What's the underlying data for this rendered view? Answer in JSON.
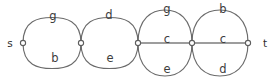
{
  "figure": {
    "type": "graph-diagram",
    "name": "multigraph-parallel-edges",
    "background_color": "#ffffff",
    "edge_color": "#6b6b6b",
    "label_color": "#3d3d3d",
    "width": 278,
    "height": 83
  },
  "terminals": [
    {
      "id": "s",
      "label": "s",
      "x": 10,
      "y": 44
    },
    {
      "id": "t",
      "label": "t",
      "x": 265,
      "y": 44
    }
  ],
  "vertices": [
    {
      "id": "v0",
      "x": 23,
      "y": 43,
      "r": 2.6
    },
    {
      "id": "v1",
      "x": 81,
      "y": 43,
      "r": 2.6
    },
    {
      "id": "v2",
      "x": 138,
      "y": 43,
      "r": 2.6
    },
    {
      "id": "v3",
      "x": 192,
      "y": 43,
      "r": 2.6
    },
    {
      "id": "v4",
      "x": 248,
      "y": 43,
      "r": 2.6
    }
  ],
  "edges": [
    {
      "id": "e0",
      "from": "v0",
      "to": "v1",
      "position": "top",
      "label": "g",
      "label_x": 53,
      "label_y": 16
    },
    {
      "id": "e1",
      "from": "v0",
      "to": "v1",
      "position": "bottom",
      "label": "b",
      "label_x": 55,
      "label_y": 58
    },
    {
      "id": "e2",
      "from": "v1",
      "to": "v2",
      "position": "top",
      "label": "d",
      "label_x": 109,
      "label_y": 15
    },
    {
      "id": "e3",
      "from": "v1",
      "to": "v2",
      "position": "bottom",
      "label": "e",
      "label_x": 110,
      "label_y": 58
    },
    {
      "id": "e4",
      "from": "v2",
      "to": "v3",
      "position": "top",
      "label": "g",
      "label_x": 167,
      "label_y": 9
    },
    {
      "id": "e5",
      "from": "v2",
      "to": "v3",
      "position": "middle",
      "label": "c",
      "label_x": 167,
      "label_y": 39
    },
    {
      "id": "e6",
      "from": "v2",
      "to": "v3",
      "position": "bottom",
      "label": "e",
      "label_x": 167,
      "label_y": 69
    },
    {
      "id": "e7",
      "from": "v3",
      "to": "v4",
      "position": "top",
      "label": "b",
      "label_x": 223,
      "label_y": 9
    },
    {
      "id": "e8",
      "from": "v3",
      "to": "v4",
      "position": "middle",
      "label": "c",
      "label_x": 223,
      "label_y": 39
    },
    {
      "id": "e9",
      "from": "v3",
      "to": "v4",
      "position": "bottom",
      "label": "d",
      "label_x": 223,
      "label_y": 69
    }
  ],
  "edge_geometry": [
    {
      "id": "e0",
      "d": "M 23 43 C 23 20.5 38.5 17.5 52 17.5 C 65.5 17.5 81 20.5 81 43"
    },
    {
      "id": "e1",
      "d": "M 23 43 C 23 65.5 38.5 68.5 52 68.5 C 65.5 68.5 81 65.5 81 43"
    },
    {
      "id": "e2",
      "d": "M 81 43 C 81 20.5 96 17.5 109.5 17.5 C 123 17.5 138 20.5 138 43"
    },
    {
      "id": "e3",
      "d": "M 81 43 C 81 65.5 96 68.5 109.5 68.5 C 123 68.5 138 65.5 138 43"
    },
    {
      "id": "e4",
      "d": "M 138 43 C 138 18 152 10 165 10 C 178 10 192 18 192 43"
    },
    {
      "id": "e5",
      "d": "M 138 43 L 192 43"
    },
    {
      "id": "e6",
      "d": "M 138 43 C 138 68 152 76 165 76 C 178 76 192 68 192 43"
    },
    {
      "id": "e7",
      "d": "M 192 43 C 192 18 206.5 10 220 10 C 233.5 10 248 18 248 43"
    },
    {
      "id": "e8",
      "d": "M 192 43 L 248 43"
    },
    {
      "id": "e9",
      "d": "M 192 43 C 192 68 206.5 76 220 76 C 233.5 76 248 68 248 43"
    }
  ]
}
